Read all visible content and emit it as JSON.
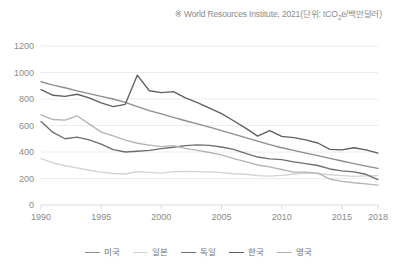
{
  "source_note": {
    "prefix": "※ World Resources Institute, 2021(단위: tCO",
    "sub": "2",
    "suffix": "e/백만달러)"
  },
  "legend": {
    "position": "bottom-center",
    "items": [
      {
        "label": "미국",
        "color": "#8d8d8d"
      },
      {
        "label": "일본",
        "color": "#d2d2d2"
      },
      {
        "label": "독일",
        "color": "#6e6e6e"
      },
      {
        "label": "한국",
        "color": "#5f5f5f"
      },
      {
        "label": "영국",
        "color": "#b4b4b4"
      }
    ]
  },
  "axes": {
    "y_ticks": [
      "1200",
      "1000",
      "800",
      "600",
      "400",
      "200",
      "0"
    ],
    "x_ticks": [
      "1990",
      "1995",
      "2000",
      "2005",
      "2010",
      "2015",
      "2018"
    ]
  },
  "chart_data": {
    "type": "line",
    "title": "",
    "subtitle": "",
    "xlabel": "",
    "ylabel": "",
    "unit": "tCO2e/백만달러",
    "source": "World Resources Institute, 2021",
    "grid": true,
    "legend_position": "bottom",
    "xlim": [
      1990,
      2018
    ],
    "ylim": [
      0,
      1200
    ],
    "y_tick_values": [
      0,
      200,
      400,
      600,
      800,
      1000,
      1200
    ],
    "x_tick_values": [
      1990,
      1995,
      2000,
      2005,
      2010,
      2015,
      2018
    ],
    "x": [
      1990,
      1991,
      1992,
      1993,
      1994,
      1995,
      1996,
      1997,
      1998,
      1999,
      2000,
      2001,
      2002,
      2003,
      2004,
      2005,
      2006,
      2007,
      2008,
      2009,
      2010,
      2011,
      2012,
      2013,
      2014,
      2015,
      2016,
      2017,
      2018
    ],
    "series": [
      {
        "name": "미국",
        "name_en": "United States",
        "color": "#8d8d8d",
        "values": [
          930,
          905,
          885,
          862,
          840,
          820,
          800,
          775,
          742,
          712,
          688,
          662,
          636,
          612,
          588,
          562,
          535,
          508,
          482,
          455,
          432,
          412,
          392,
          372,
          352,
          332,
          312,
          294,
          276
        ]
      },
      {
        "name": "일본",
        "name_en": "Japan",
        "color": "#d2d2d2",
        "values": [
          350,
          318,
          296,
          280,
          262,
          248,
          238,
          234,
          252,
          246,
          240,
          252,
          254,
          252,
          250,
          244,
          236,
          232,
          222,
          218,
          224,
          234,
          240,
          238,
          228,
          222,
          216,
          220,
          222
        ]
      },
      {
        "name": "독일",
        "name_en": "Germany",
        "color": "#6e6e6e",
        "values": [
          630,
          548,
          500,
          512,
          492,
          460,
          418,
          400,
          406,
          412,
          426,
          436,
          448,
          454,
          450,
          438,
          420,
          390,
          362,
          348,
          342,
          326,
          312,
          298,
          272,
          258,
          250,
          232,
          192
        ]
      },
      {
        "name": "한국",
        "name_en": "Korea",
        "color": "#5f5f5f",
        "values": [
          870,
          828,
          820,
          836,
          808,
          770,
          742,
          760,
          980,
          862,
          848,
          856,
          808,
          772,
          732,
          690,
          636,
          580,
          520,
          562,
          518,
          508,
          492,
          468,
          420,
          416,
          432,
          416,
          392
        ]
      },
      {
        "name": "영국",
        "name_en": "United Kingdom",
        "color": "#b4b4b4",
        "values": [
          680,
          645,
          640,
          672,
          612,
          550,
          522,
          490,
          466,
          452,
          440,
          448,
          428,
          412,
          396,
          378,
          350,
          328,
          302,
          288,
          268,
          248,
          248,
          240,
          196,
          178,
          168,
          160,
          150
        ]
      }
    ]
  },
  "style": {
    "axis_color": "#d9d9d9",
    "grid_color": "#ececec",
    "tick_label_color": "#8a8a8a",
    "background": "#ffffff"
  }
}
